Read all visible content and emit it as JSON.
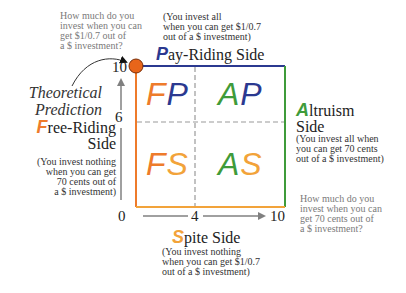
{
  "colors": {
    "orange": "#ee7b2b",
    "blue": "#2b3990",
    "green": "#3f9b3a",
    "spite_orange": "#f2a33a",
    "axis_gray": "#808080",
    "dash_gray": "#9a9a9a",
    "dot": "#e8651a"
  },
  "top_left_question": {
    "lines": [
      "How much do you",
      "invest when you can",
      "get $1/0.7 out of",
      "a $ investment?"
    ]
  },
  "bottom_right_question": {
    "lines": [
      "How much do you",
      "invest when you can",
      "get 70 cents out of",
      "a $ investment?"
    ]
  },
  "theoretical_prediction": {
    "lines": [
      "Theoretical",
      "Prediction"
    ]
  },
  "pay_riding": {
    "note_lines": [
      "(You invest all",
      "when you can get $1/0.7",
      "out of a $ investment)"
    ],
    "cap": "P",
    "rest": "ay-Riding Side"
  },
  "free_riding": {
    "cap": "F",
    "rest_line1": "ree-Riding",
    "line2": "Side",
    "note_lines": [
      "(You invest nothing",
      "when you can get",
      "70 cents out of",
      "a $ investment)"
    ]
  },
  "altruism": {
    "cap": "A",
    "rest_line1": "ltruism",
    "line2": "Side",
    "note_lines": [
      "(You invest all when",
      "you can get 70 cents",
      "out of a $ investment)"
    ]
  },
  "spite": {
    "cap": "S",
    "rest": "pite Side",
    "note_lines": [
      "(You invest nothing",
      "when you can get $1/0.7",
      "out of a $ investment)"
    ]
  },
  "quadrants": {
    "FP": {
      "first": "F",
      "second": "P"
    },
    "AP": {
      "first": "A",
      "second": "P"
    },
    "FS": {
      "first": "F",
      "second": "S"
    },
    "AS": {
      "first": "A",
      "second": "S"
    }
  },
  "axes": {
    "y_ticks": {
      "top": "10",
      "mid": "6"
    },
    "x_ticks": {
      "origin": "0",
      "mid": "4",
      "end": "10"
    }
  }
}
